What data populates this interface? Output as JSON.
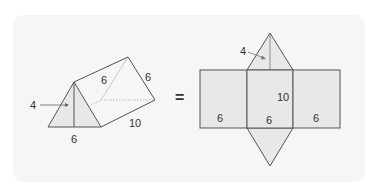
{
  "diagram": {
    "equals_sign": "=",
    "colors": {
      "card_background": "#f6f6f6",
      "face_fill": "#e8e8e8",
      "stroke": "#555555",
      "text": "#333333"
    },
    "prism": {
      "labels": {
        "height": "4",
        "base": "6",
        "slant_front": "6",
        "slant_back": "6",
        "length": "10"
      }
    },
    "net": {
      "labels": {
        "triangle_height": "4",
        "length": "10",
        "left_width": "6",
        "middle_width": "6",
        "right_width": "6"
      }
    }
  }
}
